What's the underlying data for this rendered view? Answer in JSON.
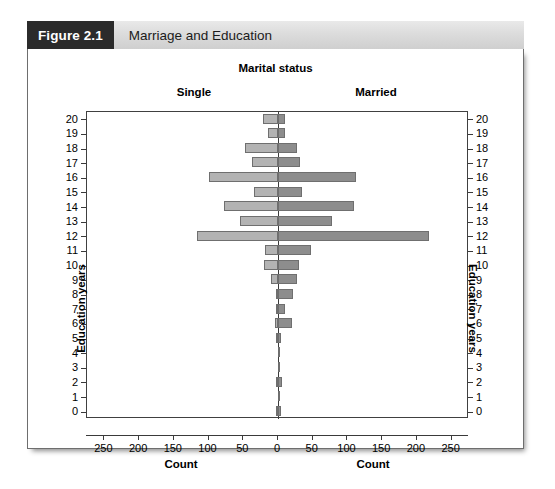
{
  "figure": {
    "number": "Figure 2.1",
    "caption": "Marriage and Education"
  },
  "chart_data": {
    "type": "bar",
    "orientation": "horizontal-pyramid",
    "title": "Marital status",
    "panels": [
      "Single",
      "Married"
    ],
    "xlabel_left": "Count",
    "xlabel_right": "Count",
    "ylabel_left": "Education years",
    "ylabel_right": "Education years",
    "categories": [
      20,
      19,
      18,
      17,
      16,
      15,
      14,
      13,
      12,
      11,
      10,
      9,
      8,
      7,
      6,
      5,
      4,
      3,
      2,
      1,
      0
    ],
    "xticks_left": [
      250,
      200,
      150,
      100,
      50,
      0
    ],
    "xticks_right": [
      0,
      50,
      100,
      150,
      200,
      250
    ],
    "xlim": [
      0,
      275
    ],
    "grid": false,
    "legend": "none",
    "series": [
      {
        "name": "Single",
        "side": "left",
        "color": "#b3b3b3",
        "values": [
          22,
          15,
          48,
          38,
          100,
          35,
          78,
          55,
          116,
          18,
          20,
          10,
          3,
          2,
          5,
          2,
          0,
          0,
          2,
          0,
          1
        ]
      },
      {
        "name": "Married",
        "side": "right",
        "color": "#8d8d8d",
        "values": [
          10,
          10,
          28,
          32,
          112,
          35,
          110,
          78,
          218,
          48,
          30,
          28,
          22,
          10,
          20,
          5,
          1,
          1,
          6,
          1,
          5
        ]
      }
    ]
  },
  "colors": {
    "header_dark": "#2b2b2b",
    "header_gray": "#dcdcdc",
    "bar_single": "#b3b3b3",
    "bar_married": "#8d8d8d",
    "axis": "#3a3a3a"
  }
}
